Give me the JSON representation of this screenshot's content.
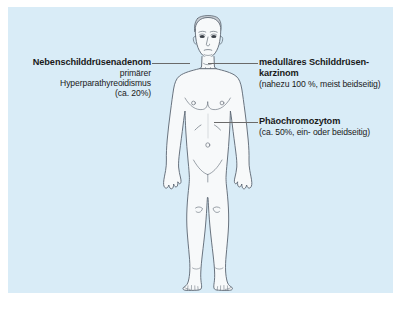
{
  "figure": {
    "background_color": "#d9ecf7",
    "page_color": "#ffffff",
    "body_outline_color": "#5a6470",
    "body_fill_color": "#f7f9fa",
    "leader_line_color": "#6a6a6a",
    "text_color": "#1a1a1a"
  },
  "annotations": {
    "parathyroid": {
      "title": "Nebenschilddrüsenadenom",
      "line2": "primärer",
      "line3": "Hyperparathyreoidismus",
      "line4": "(ca. 20%)"
    },
    "thyroid": {
      "title_line1": "medulläres Schilddrüsen-",
      "title_line2": "karzinom",
      "detail": "(nahezu 100 %, meist beidseitig)"
    },
    "pheochromocytoma": {
      "title": "Phäochromozytom",
      "detail": "(ca. 50%, ein- oder beidseitig)"
    }
  }
}
